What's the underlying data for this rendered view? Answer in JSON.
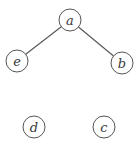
{
  "diagram": {
    "type": "graph",
    "directed": false,
    "colors": {
      "stroke": "#555555",
      "text": "#3a3a3a",
      "background": "#ffffff"
    },
    "node_radius": 11,
    "nodes": [
      {
        "id": "a",
        "label": "a",
        "x": 70,
        "y": 20
      },
      {
        "id": "e",
        "label": "e",
        "x": 17,
        "y": 61
      },
      {
        "id": "b",
        "label": "b",
        "x": 122,
        "y": 63
      },
      {
        "id": "d",
        "label": "d",
        "x": 34,
        "y": 127
      },
      {
        "id": "c",
        "label": "c",
        "x": 104,
        "y": 127
      }
    ],
    "edges": [
      {
        "from": "a",
        "to": "e"
      },
      {
        "from": "a",
        "to": "b"
      }
    ]
  }
}
